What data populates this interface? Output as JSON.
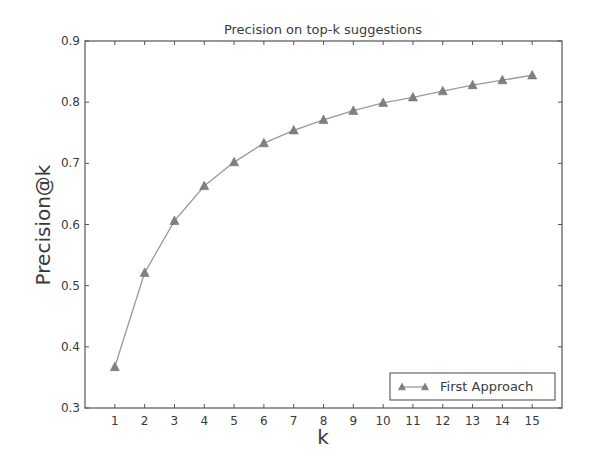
{
  "chart_data": {
    "type": "line",
    "title": "Precision on top-k suggestions",
    "xlabel": "k",
    "ylabel": "Precision@k",
    "x": [
      1,
      2,
      3,
      4,
      5,
      6,
      7,
      8,
      9,
      10,
      11,
      12,
      13,
      14,
      15
    ],
    "series": [
      {
        "name": "First Approach",
        "marker": "triangle",
        "color": "#808080",
        "values": [
          0.367,
          0.521,
          0.606,
          0.663,
          0.702,
          0.733,
          0.754,
          0.771,
          0.786,
          0.799,
          0.808,
          0.818,
          0.828,
          0.836,
          0.844
        ]
      }
    ],
    "xlim": [
      0,
      16
    ],
    "ylim": [
      0.3,
      0.9
    ],
    "xticks": [
      "1",
      "2",
      "3",
      "4",
      "5",
      "6",
      "7",
      "8",
      "9",
      "10",
      "11",
      "12",
      "13",
      "14",
      "15"
    ],
    "yticks": [
      "0.3",
      "0.4",
      "0.5",
      "0.6",
      "0.7",
      "0.8",
      "0.9"
    ],
    "grid": false,
    "legend_position": "lower right"
  },
  "colors": {
    "axis": "#555555",
    "line": "#9a9a9a",
    "marker": "#808080",
    "text": "#3a3a3a",
    "background": "#ffffff"
  }
}
